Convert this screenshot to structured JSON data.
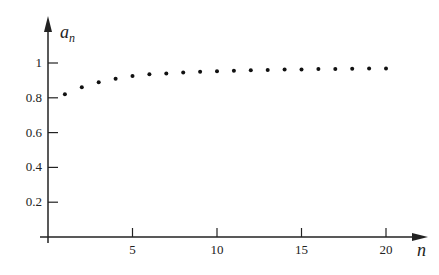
{
  "chart_data": {
    "type": "scatter",
    "title": "",
    "xlabel": "n",
    "ylabel": "a_n",
    "xlim": [
      0,
      21.5
    ],
    "ylim": [
      0,
      1.1
    ],
    "x_ticks": [
      5,
      10,
      15,
      20
    ],
    "x_tick_labels": [
      "5",
      "10",
      "15",
      "20"
    ],
    "y_ticks": [
      0.2,
      0.4,
      0.6,
      0.8,
      1
    ],
    "y_tick_labels": [
      "0.2",
      "0.4",
      "0.6",
      "0.8",
      "1"
    ],
    "grid": false,
    "legend": null,
    "series": [
      {
        "name": "a_n",
        "x": [
          1,
          2,
          3,
          4,
          5,
          6,
          7,
          8,
          9,
          10,
          11,
          12,
          13,
          14,
          15,
          16,
          17,
          18,
          19,
          20
        ],
        "values": [
          0.82,
          0.86,
          0.89,
          0.91,
          0.925,
          0.935,
          0.94,
          0.945,
          0.95,
          0.953,
          0.956,
          0.958,
          0.96,
          0.962,
          0.963,
          0.965,
          0.966,
          0.967,
          0.968,
          0.969
        ]
      }
    ]
  },
  "labels": {
    "y_axis_main": "a",
    "y_axis_sub": "n",
    "x_axis": "n"
  }
}
